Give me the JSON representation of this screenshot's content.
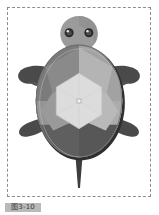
{
  "document": {
    "title": "Turtle illustration",
    "caption": "图3-10",
    "background_color": "#ffffff"
  },
  "canvas": {
    "frame_style": "dashed",
    "frame_color": "#8d8d8d",
    "background_color": "#ffffff"
  },
  "figure": {
    "colors": {
      "shell_outline": "#3b3b3b",
      "shell_rim": "#6f6f6f",
      "shell_dark_left": "#7b7b7b",
      "shell_mid": "#8d8d8d",
      "shell_light": "#a9a9a9",
      "shell_lighter": "#bdbdbd",
      "shell_bottom_dark": "#5c5c5c",
      "shell_center": "#d8d8d8",
      "head": "#9b9b9b",
      "head_shadow": "#8a8a8a",
      "neck": "#9e9e9e",
      "limb": "#4a4a4a",
      "tail": "#3d3d3d",
      "eye": "#2a2a2a",
      "eye_highlight": "#e8e8e8"
    },
    "parts": [
      {
        "name": "head",
        "label": "Head"
      },
      {
        "name": "left-eye",
        "label": "Left eye"
      },
      {
        "name": "right-eye",
        "label": "Right eye"
      },
      {
        "name": "neck",
        "label": "Neck"
      },
      {
        "name": "shell",
        "label": "Carapace"
      },
      {
        "name": "shell-center-plate",
        "label": "Central scute"
      },
      {
        "name": "front-left-flipper",
        "label": "Front left flipper"
      },
      {
        "name": "front-right-flipper",
        "label": "Front right flipper"
      },
      {
        "name": "rear-left-flipper",
        "label": "Rear left flipper"
      },
      {
        "name": "rear-right-flipper",
        "label": "Rear right flipper"
      },
      {
        "name": "tail",
        "label": "Tail"
      }
    ]
  },
  "selection": {
    "visible": true,
    "marker_color": "#f2f2f2",
    "marker_border": "#8a8a8a"
  }
}
